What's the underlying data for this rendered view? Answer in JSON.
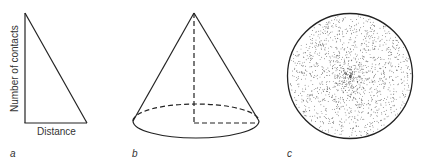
{
  "panels": [
    {
      "id": "a",
      "label": "a",
      "type": "triangle-graph",
      "xlabel": "Distance",
      "ylabel": "Number of contacts"
    },
    {
      "id": "b",
      "label": "b",
      "type": "cone"
    },
    {
      "id": "c",
      "label": "c",
      "type": "stippled-circle",
      "description": "dot density highest at center, decreasing toward edge"
    }
  ],
  "colors": {
    "stroke": "#222222",
    "dots": "#444444",
    "background": "#ffffff"
  }
}
